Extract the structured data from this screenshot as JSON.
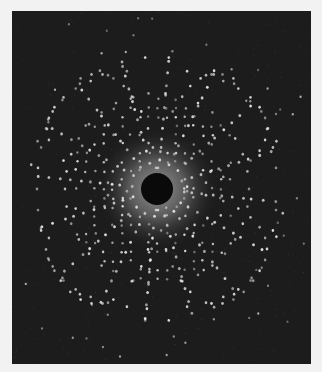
{
  "image": {
    "subject": "X-ray diffraction (Laue) pattern photograph",
    "frame": {
      "x": 12,
      "y": 11,
      "width": 299,
      "height": 353,
      "border_color": "#f2f2f2",
      "background": "#1c1c1c"
    },
    "center": {
      "x": 145,
      "y": 178
    },
    "beam_stop": {
      "radius": 16,
      "color": "#0a0a0a"
    },
    "halo": {
      "radius": 62,
      "inner_color": "#9a9a9a",
      "outer_color": "#1c1c1c"
    },
    "spot_color": "#e8e8e8",
    "pattern": {
      "radial_lines": 16,
      "rings": [
        26,
        36,
        46,
        56,
        66,
        76,
        86,
        96,
        108,
        120
      ],
      "outer_ellipse": {
        "rx": 128,
        "ry": 132
      },
      "symmetry": "fourfold"
    }
  }
}
